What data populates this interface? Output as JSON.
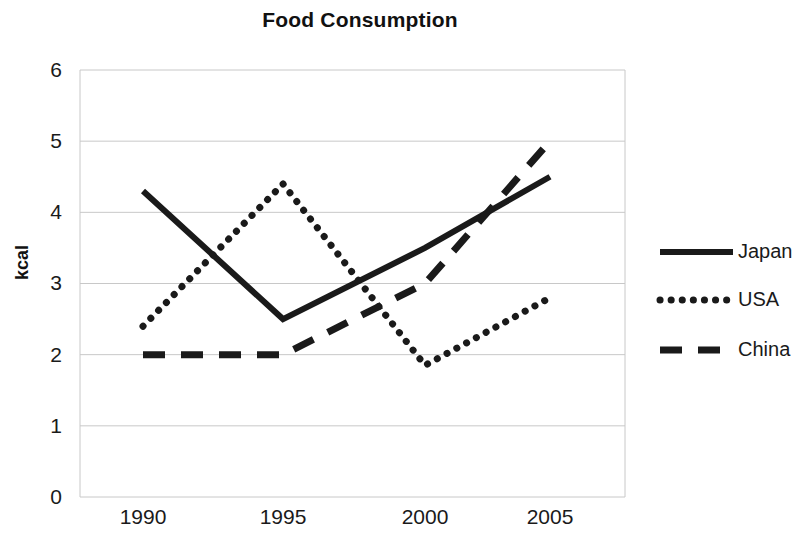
{
  "chart_data": {
    "type": "line",
    "title": "Food Consumption",
    "xlabel": "",
    "ylabel": "kcal",
    "categories": [
      "1990",
      "1995",
      "2000",
      "2005"
    ],
    "x": [
      1990,
      1995,
      2000,
      2005
    ],
    "series": [
      {
        "name": "Japan",
        "style": "solid",
        "values": [
          4.3,
          2.5,
          3.5,
          4.5
        ]
      },
      {
        "name": "USA",
        "style": "dotted",
        "values": [
          2.4,
          4.4,
          1.85,
          2.8
        ]
      },
      {
        "name": "China",
        "style": "dashed",
        "values": [
          2.0,
          2.0,
          3.0,
          5.0
        ]
      }
    ],
    "ylim": [
      0,
      6
    ],
    "yticks": [
      "0",
      "1",
      "2",
      "3",
      "4",
      "5",
      "6"
    ],
    "grid": true,
    "legend_position": "right",
    "line_color": "#1a1a1a",
    "grid_color": "#c8c8c8"
  },
  "legend": {
    "items": [
      {
        "label": "Japan"
      },
      {
        "label": "USA"
      },
      {
        "label": "China"
      }
    ]
  }
}
